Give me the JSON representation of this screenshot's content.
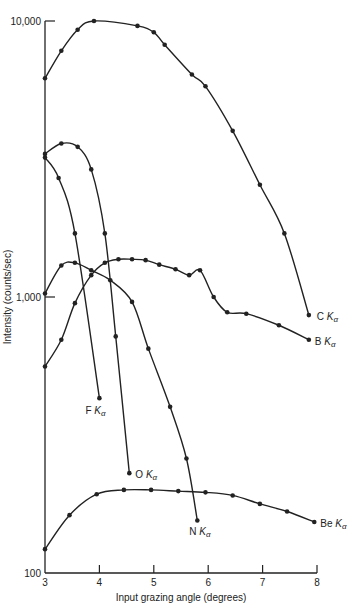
{
  "chart_data": {
    "type": "line",
    "title": "",
    "xlabel": "Input grazing angle (degrees)",
    "ylabel": "Intensity (counts/sec)",
    "xlim": [
      3,
      8
    ],
    "ylim": [
      100,
      10000
    ],
    "yscale": "log",
    "x_ticks": [
      "3",
      "4",
      "5",
      "6",
      "7",
      "8"
    ],
    "y_ticks": [
      "100",
      "1,000",
      "10,000"
    ],
    "series": [
      {
        "name": "C Kα",
        "x": [
          3.0,
          3.3,
          3.6,
          3.9,
          4.7,
          5.0,
          5.2,
          5.7,
          5.95,
          6.45,
          6.95,
          7.4,
          7.85
        ],
        "y": [
          6200,
          7800,
          9300,
          10000,
          9600,
          9100,
          8200,
          6400,
          5800,
          4000,
          2550,
          1700,
          860
        ]
      },
      {
        "name": "B Kα",
        "x": [
          3.0,
          3.3,
          3.55,
          3.85,
          4.1,
          4.35,
          4.6,
          4.85,
          5.1,
          5.4,
          5.65,
          5.85,
          6.1,
          6.35,
          6.7,
          7.3,
          7.85
        ],
        "y": [
          560,
          700,
          950,
          1200,
          1330,
          1370,
          1370,
          1360,
          1310,
          1260,
          1200,
          1250,
          1000,
          880,
          870,
          790,
          700
        ]
      },
      {
        "name": "F Kα",
        "x": [
          3.0,
          3.25,
          3.55,
          4.0
        ],
        "y": [
          3200,
          2700,
          1700,
          430
        ]
      },
      {
        "name": "O Kα",
        "x": [
          3.0,
          3.3,
          3.6,
          3.85,
          4.1,
          4.3,
          4.55
        ],
        "y": [
          3300,
          3600,
          3500,
          2900,
          1700,
          720,
          230
        ]
      },
      {
        "name": "N Kα",
        "x": [
          3.0,
          3.3,
          3.55,
          3.85,
          4.2,
          4.6,
          4.9,
          5.3,
          5.6,
          5.8
        ],
        "y": [
          1030,
          1300,
          1330,
          1250,
          1150,
          960,
          650,
          400,
          260,
          155
        ]
      },
      {
        "name": "Be Kα",
        "x": [
          3.0,
          3.45,
          3.95,
          4.45,
          4.95,
          5.45,
          5.95,
          6.45,
          6.95,
          7.45,
          7.95
        ],
        "y": [
          122,
          162,
          193,
          200,
          200,
          198,
          196,
          191,
          178,
          167,
          153
        ]
      }
    ],
    "annotations": [
      "C Kα",
      "B Kα",
      "F Kα",
      "O Kα",
      "N Kα",
      "Be Kα"
    ],
    "grid": false,
    "legend": "inline labels at curve ends"
  }
}
